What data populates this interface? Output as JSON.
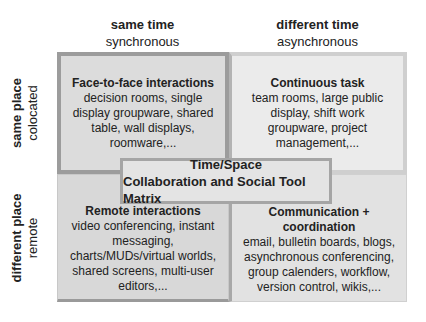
{
  "diagram": {
    "title_line1": "Time/Space",
    "title_line2": "Collaboration and Social Tool Matrix",
    "columns": [
      {
        "label": "same time",
        "sublabel": "synchronous"
      },
      {
        "label": "different time",
        "sublabel": "asynchronous"
      }
    ],
    "rows": [
      {
        "label": "same place",
        "sublabel": "colocated"
      },
      {
        "label": "different place",
        "sublabel": "remote"
      }
    ],
    "cells": [
      {
        "title": "Face-to-face interactions",
        "body": "decision rooms, single display groupware, shared table, wall displays, roomware,..."
      },
      {
        "title": "Continuous task",
        "body": "team rooms, large public display, shift work groupware, project management,..."
      },
      {
        "title": "Remote interactions",
        "body": "video conferencing, instant messaging, charts/MUDs/virtual worlds, shared screens, multi-user editors,..."
      },
      {
        "title": "Communication + coordination",
        "body": "email, bulletin boards, blogs, asynchronous conferencing, group calenders, workflow, version control, wikis,..."
      }
    ]
  }
}
